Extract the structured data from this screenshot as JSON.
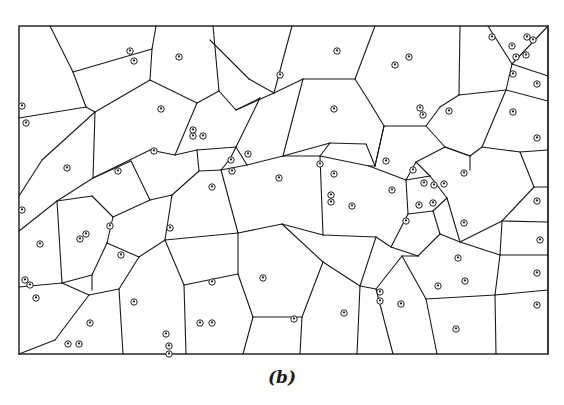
{
  "figure": {
    "caption": "(b)",
    "type": "voronoi-diagram",
    "line_color": "#1a1a1a",
    "frame": {
      "x": 19,
      "y": 26,
      "width": 529,
      "height": 328
    }
  },
  "sites": [
    [
      130,
      51
    ],
    [
      134,
      61
    ],
    [
      179,
      57
    ],
    [
      22,
      106
    ],
    [
      26,
      123
    ],
    [
      161,
      109
    ],
    [
      280,
      75
    ],
    [
      337,
      51
    ],
    [
      334,
      109
    ],
    [
      395,
      65
    ],
    [
      409,
      57
    ],
    [
      492,
      37
    ],
    [
      512,
      46
    ],
    [
      527,
      37
    ],
    [
      533,
      40
    ],
    [
      516,
      57
    ],
    [
      526,
      55
    ],
    [
      513,
      74
    ],
    [
      537,
      84
    ],
    [
      420,
      108
    ],
    [
      423,
      115
    ],
    [
      449,
      111
    ],
    [
      513,
      112
    ],
    [
      67,
      168
    ],
    [
      118,
      171
    ],
    [
      154,
      151
    ],
    [
      193,
      130
    ],
    [
      193,
      136
    ],
    [
      203,
      136
    ],
    [
      212,
      187
    ],
    [
      231,
      160
    ],
    [
      232,
      171
    ],
    [
      248,
      154
    ],
    [
      279,
      178
    ],
    [
      320,
      164
    ],
    [
      334,
      174
    ],
    [
      331,
      195
    ],
    [
      331,
      202
    ],
    [
      352,
      206
    ],
    [
      386,
      161
    ],
    [
      392,
      190
    ],
    [
      413,
      170
    ],
    [
      424,
      183
    ],
    [
      434,
      185
    ],
    [
      444,
      184
    ],
    [
      433,
      203
    ],
    [
      419,
      205
    ],
    [
      406,
      221
    ],
    [
      464,
      173
    ],
    [
      537,
      138
    ],
    [
      537,
      201
    ],
    [
      22,
      210
    ],
    [
      40,
      244
    ],
    [
      80,
      239
    ],
    [
      86,
      234
    ],
    [
      110,
      226
    ],
    [
      121,
      255
    ],
    [
      170,
      228
    ],
    [
      263,
      278
    ],
    [
      212,
      282
    ],
    [
      464,
      223
    ],
    [
      540,
      240
    ],
    [
      25,
      280
    ],
    [
      30,
      285
    ],
    [
      36,
      298
    ],
    [
      90,
      323
    ],
    [
      134,
      302
    ],
    [
      212,
      323
    ],
    [
      200,
      323
    ],
    [
      166,
      334
    ],
    [
      169,
      346
    ],
    [
      169,
      354
    ],
    [
      68,
      344
    ],
    [
      79,
      344
    ],
    [
      294,
      319
    ],
    [
      344,
      313
    ],
    [
      380,
      292
    ],
    [
      380,
      301
    ],
    [
      401,
      304
    ],
    [
      438,
      286
    ],
    [
      458,
      258
    ],
    [
      465,
      281
    ],
    [
      456,
      329
    ],
    [
      537,
      273
    ],
    [
      537,
      305
    ]
  ],
  "edges": [
    [
      [
        50,
        26
      ],
      [
        73,
        72
      ]
    ],
    [
      [
        73,
        72
      ],
      [
        86,
        107
      ]
    ],
    [
      [
        86,
        107
      ],
      [
        19,
        118
      ]
    ],
    [
      [
        73,
        72
      ],
      [
        152,
        49
      ]
    ],
    [
      [
        152,
        49
      ],
      [
        156,
        26
      ]
    ],
    [
      [
        152,
        49
      ],
      [
        150,
        80
      ]
    ],
    [
      [
        150,
        80
      ],
      [
        95,
        112
      ]
    ],
    [
      [
        86,
        107
      ],
      [
        95,
        112
      ]
    ],
    [
      [
        95,
        112
      ],
      [
        42,
        160
      ]
    ],
    [
      [
        42,
        160
      ],
      [
        19,
        196
      ]
    ],
    [
      [
        95,
        112
      ],
      [
        93,
        178
      ]
    ],
    [
      [
        150,
        80
      ],
      [
        197,
        103
      ]
    ],
    [
      [
        197,
        103
      ],
      [
        219,
        91
      ]
    ],
    [
      [
        219,
        91
      ],
      [
        213,
        26
      ]
    ],
    [
      [
        219,
        91
      ],
      [
        236,
        110
      ]
    ],
    [
      [
        236,
        110
      ],
      [
        274,
        93
      ]
    ],
    [
      [
        274,
        93
      ],
      [
        292,
        26
      ]
    ],
    [
      [
        274,
        93
      ],
      [
        249,
        79
      ]
    ],
    [
      [
        249,
        79
      ],
      [
        210,
        40
      ]
    ],
    [
      [
        274,
        93
      ],
      [
        303,
        79
      ]
    ],
    [
      [
        303,
        79
      ],
      [
        355,
        79
      ]
    ],
    [
      [
        355,
        79
      ],
      [
        375,
        26
      ]
    ],
    [
      [
        303,
        79
      ],
      [
        283,
        156
      ]
    ],
    [
      [
        355,
        79
      ],
      [
        372,
        106
      ]
    ],
    [
      [
        372,
        106
      ],
      [
        384,
        126
      ]
    ],
    [
      [
        384,
        126
      ],
      [
        375,
        166
      ]
    ],
    [
      [
        236,
        110
      ],
      [
        260,
        98
      ]
    ],
    [
      [
        260,
        98
      ],
      [
        236,
        147
      ]
    ],
    [
      [
        197,
        103
      ],
      [
        175,
        155
      ]
    ],
    [
      [
        175,
        155
      ],
      [
        150,
        150
      ]
    ],
    [
      [
        150,
        150
      ],
      [
        93,
        178
      ]
    ],
    [
      [
        93,
        178
      ],
      [
        57,
        201
      ]
    ],
    [
      [
        57,
        201
      ],
      [
        19,
        231
      ]
    ],
    [
      [
        175,
        155
      ],
      [
        197,
        150
      ]
    ],
    [
      [
        197,
        150
      ],
      [
        236,
        147
      ]
    ],
    [
      [
        236,
        147
      ],
      [
        247,
        165
      ]
    ],
    [
      [
        247,
        165
      ],
      [
        283,
        156
      ]
    ],
    [
      [
        283,
        156
      ],
      [
        330,
        143
      ]
    ],
    [
      [
        330,
        143
      ],
      [
        366,
        144
      ]
    ],
    [
      [
        366,
        144
      ],
      [
        375,
        166
      ]
    ],
    [
      [
        197,
        150
      ],
      [
        199,
        171
      ]
    ],
    [
      [
        199,
        171
      ],
      [
        221,
        170
      ]
    ],
    [
      [
        221,
        170
      ],
      [
        247,
        165
      ]
    ],
    [
      [
        221,
        170
      ],
      [
        230,
        159
      ]
    ],
    [
      [
        230,
        159
      ],
      [
        236,
        147
      ]
    ],
    [
      [
        199,
        171
      ],
      [
        172,
        195
      ]
    ],
    [
      [
        172,
        195
      ],
      [
        165,
        240
      ]
    ],
    [
      [
        165,
        240
      ],
      [
        184,
        285
      ]
    ],
    [
      [
        184,
        285
      ],
      [
        186,
        354
      ]
    ],
    [
      [
        172,
        195
      ],
      [
        150,
        200
      ]
    ],
    [
      [
        150,
        200
      ],
      [
        131,
        161
      ]
    ],
    [
      [
        131,
        161
      ],
      [
        93,
        178
      ]
    ],
    [
      [
        150,
        200
      ],
      [
        113,
        217
      ]
    ],
    [
      [
        113,
        217
      ],
      [
        92,
        196
      ]
    ],
    [
      [
        92,
        196
      ],
      [
        57,
        201
      ]
    ],
    [
      [
        113,
        217
      ],
      [
        107,
        243
      ]
    ],
    [
      [
        107,
        243
      ],
      [
        92,
        275
      ]
    ],
    [
      [
        92,
        275
      ],
      [
        62,
        283
      ]
    ],
    [
      [
        62,
        283
      ],
      [
        19,
        287
      ]
    ],
    [
      [
        57,
        201
      ],
      [
        62,
        283
      ]
    ],
    [
      [
        107,
        243
      ],
      [
        139,
        257
      ]
    ],
    [
      [
        139,
        257
      ],
      [
        165,
        240
      ]
    ],
    [
      [
        139,
        257
      ],
      [
        119,
        289
      ]
    ],
    [
      [
        119,
        289
      ],
      [
        123,
        354
      ]
    ],
    [
      [
        119,
        289
      ],
      [
        89,
        295
      ]
    ],
    [
      [
        89,
        295
      ],
      [
        62,
        283
      ]
    ],
    [
      [
        89,
        295
      ],
      [
        55,
        340
      ]
    ],
    [
      [
        55,
        340
      ],
      [
        19,
        354
      ]
    ],
    [
      [
        92,
        275
      ],
      [
        92,
        290
      ]
    ],
    [
      [
        221,
        170
      ],
      [
        238,
        233
      ]
    ],
    [
      [
        238,
        233
      ],
      [
        165,
        240
      ]
    ],
    [
      [
        238,
        233
      ],
      [
        282,
        224
      ]
    ],
    [
      [
        282,
        224
      ],
      [
        323,
        235
      ]
    ],
    [
      [
        323,
        235
      ],
      [
        320,
        156
      ]
    ],
    [
      [
        320,
        156
      ],
      [
        330,
        143
      ]
    ],
    [
      [
        283,
        156
      ],
      [
        320,
        156
      ]
    ],
    [
      [
        320,
        156
      ],
      [
        369,
        166
      ]
    ],
    [
      [
        369,
        166
      ],
      [
        375,
        166
      ]
    ],
    [
      [
        369,
        166
      ],
      [
        406,
        180
      ]
    ],
    [
      [
        406,
        180
      ],
      [
        408,
        214
      ]
    ],
    [
      [
        375,
        166
      ],
      [
        384,
        126
      ]
    ],
    [
      [
        384,
        126
      ],
      [
        426,
        126
      ]
    ],
    [
      [
        426,
        126
      ],
      [
        440,
        107
      ]
    ],
    [
      [
        440,
        107
      ],
      [
        459,
        95
      ]
    ],
    [
      [
        459,
        95
      ],
      [
        460,
        26
      ]
    ],
    [
      [
        459,
        95
      ],
      [
        506,
        90
      ]
    ],
    [
      [
        506,
        90
      ],
      [
        512,
        64
      ]
    ],
    [
      [
        512,
        64
      ],
      [
        488,
        26
      ]
    ],
    [
      [
        506,
        90
      ],
      [
        548,
        101
      ]
    ],
    [
      [
        512,
        64
      ],
      [
        548,
        26
      ]
    ],
    [
      [
        512,
        64
      ],
      [
        548,
        76
      ]
    ],
    [
      [
        426,
        126
      ],
      [
        445,
        147
      ]
    ],
    [
      [
        445,
        147
      ],
      [
        470,
        156
      ]
    ],
    [
      [
        470,
        156
      ],
      [
        482,
        147
      ]
    ],
    [
      [
        482,
        147
      ],
      [
        506,
        90
      ]
    ],
    [
      [
        482,
        147
      ],
      [
        520,
        152
      ]
    ],
    [
      [
        520,
        152
      ],
      [
        548,
        150
      ]
    ],
    [
      [
        520,
        152
      ],
      [
        534,
        187
      ]
    ],
    [
      [
        534,
        187
      ],
      [
        548,
        187
      ]
    ],
    [
      [
        534,
        187
      ],
      [
        502,
        221
      ]
    ],
    [
      [
        502,
        221
      ],
      [
        460,
        242
      ]
    ],
    [
      [
        460,
        242
      ],
      [
        440,
        234
      ]
    ],
    [
      [
        470,
        156
      ],
      [
        470,
        170
      ]
    ],
    [
      [
        470,
        156
      ],
      [
        445,
        147
      ]
    ],
    [
      [
        445,
        147
      ],
      [
        416,
        162
      ]
    ],
    [
      [
        416,
        162
      ],
      [
        406,
        180
      ]
    ],
    [
      [
        416,
        162
      ],
      [
        430,
        176
      ]
    ],
    [
      [
        430,
        176
      ],
      [
        447,
        198
      ]
    ],
    [
      [
        447,
        198
      ],
      [
        460,
        242
      ]
    ],
    [
      [
        406,
        180
      ],
      [
        430,
        176
      ]
    ],
    [
      [
        408,
        214
      ],
      [
        433,
        211
      ]
    ],
    [
      [
        433,
        211
      ],
      [
        447,
        198
      ]
    ],
    [
      [
        433,
        211
      ],
      [
        440,
        234
      ]
    ],
    [
      [
        440,
        234
      ],
      [
        418,
        256
      ]
    ],
    [
      [
        418,
        256
      ],
      [
        391,
        247
      ]
    ],
    [
      [
        391,
        247
      ],
      [
        408,
        214
      ]
    ],
    [
      [
        391,
        247
      ],
      [
        376,
        237
      ]
    ],
    [
      [
        376,
        237
      ],
      [
        323,
        235
      ]
    ],
    [
      [
        376,
        237
      ],
      [
        360,
        286
      ]
    ],
    [
      [
        360,
        286
      ],
      [
        323,
        262
      ]
    ],
    [
      [
        323,
        262
      ],
      [
        282,
        224
      ]
    ],
    [
      [
        323,
        262
      ],
      [
        302,
        317
      ]
    ],
    [
      [
        302,
        317
      ],
      [
        253,
        317
      ]
    ],
    [
      [
        253,
        317
      ],
      [
        243,
        354
      ]
    ],
    [
      [
        253,
        317
      ],
      [
        238,
        274
      ]
    ],
    [
      [
        238,
        274
      ],
      [
        238,
        233
      ]
    ],
    [
      [
        238,
        274
      ],
      [
        184,
        285
      ]
    ],
    [
      [
        302,
        317
      ],
      [
        300,
        354
      ]
    ],
    [
      [
        360,
        286
      ],
      [
        376,
        289
      ]
    ],
    [
      [
        376,
        289
      ],
      [
        393,
        354
      ]
    ],
    [
      [
        376,
        289
      ],
      [
        402,
        256
      ]
    ],
    [
      [
        402,
        256
      ],
      [
        418,
        256
      ]
    ],
    [
      [
        402,
        256
      ],
      [
        426,
        299
      ]
    ],
    [
      [
        426,
        299
      ],
      [
        437,
        354
      ]
    ],
    [
      [
        426,
        299
      ],
      [
        495,
        295
      ]
    ],
    [
      [
        495,
        295
      ],
      [
        500,
        255
      ]
    ],
    [
      [
        500,
        255
      ],
      [
        460,
        242
      ]
    ],
    [
      [
        500,
        255
      ],
      [
        548,
        255
      ]
    ],
    [
      [
        500,
        255
      ],
      [
        502,
        221
      ]
    ],
    [
      [
        502,
        221
      ],
      [
        548,
        222
      ]
    ],
    [
      [
        495,
        295
      ],
      [
        496,
        354
      ]
    ],
    [
      [
        495,
        295
      ],
      [
        548,
        290
      ]
    ],
    [
      [
        360,
        286
      ],
      [
        357,
        354
      ]
    ],
    [
      [
        548,
        26
      ],
      [
        548,
        354
      ]
    ]
  ]
}
